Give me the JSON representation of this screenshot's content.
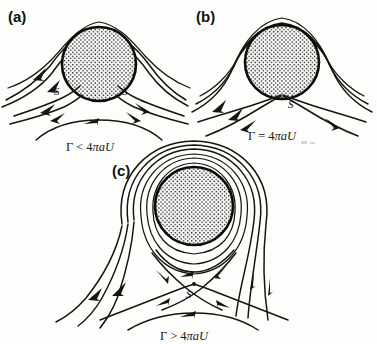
{
  "figure": {
    "background_color": "#fdfdfc",
    "ink_color": "#17150f",
    "fill_pattern": "stippled-dots"
  },
  "panels": [
    {
      "id": "a",
      "label": "(a)",
      "formula": {
        "full": "Γ < 4πaU",
        "gamma": "Γ",
        "relation": "<",
        "coefficient": "4",
        "pi": "π",
        "radius": "a",
        "velocity": "U"
      },
      "stagnation_labels": [
        "S",
        "S"
      ],
      "stagnation_count": 2,
      "description": "two stagnation points on the lower surface of the cylinder",
      "circle": {
        "cx": 99,
        "cy": 64,
        "r": 37
      }
    },
    {
      "id": "b",
      "label": "(b)",
      "formula": {
        "full": "Γ = 4πaU",
        "gamma": "Γ",
        "relation": "=",
        "coefficient": "4",
        "pi": "π",
        "radius": "a",
        "velocity": "U"
      },
      "stagnation_labels": [
        "S"
      ],
      "stagnation_count": 1,
      "description": "single stagnation point at the bottom of the cylinder",
      "circle": {
        "cx": 282,
        "cy": 62,
        "r": 37
      }
    },
    {
      "id": "c",
      "label": "(c)",
      "formula": {
        "full": "Γ > 4πaU",
        "gamma": "Γ",
        "relation": ">",
        "coefficient": "4",
        "pi": "π",
        "radius": "a",
        "velocity": "U"
      },
      "stagnation_labels": [
        "S"
      ],
      "stagnation_count": 1,
      "description": "stagnation point detached below the cylinder with closed streamlines around it",
      "circle": {
        "cx": 194,
        "cy": 206,
        "r": 39
      }
    }
  ]
}
